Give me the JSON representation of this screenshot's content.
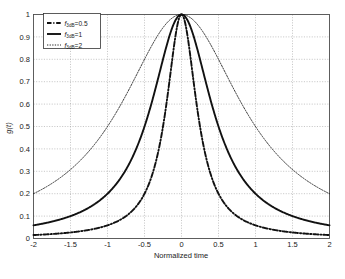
{
  "chart_data": {
    "type": "line",
    "title": "",
    "xlabel": "Normalized time",
    "ylabel": "g(t)",
    "xlim": [
      -2,
      2
    ],
    "ylim": [
      0,
      1
    ],
    "grid": true,
    "legend_position": "upper-left",
    "xticks": [
      "-2",
      "-1.5",
      "-1",
      "-0.5",
      "0",
      "0.5",
      "1",
      "1.5",
      "2"
    ],
    "xtick_values": [
      -2,
      -1.5,
      -1,
      -0.5,
      0,
      0.5,
      1,
      1.5,
      2
    ],
    "yticks": [
      "0",
      "0.1",
      "0.2",
      "0.3",
      "0.4",
      "0.5",
      "0.6",
      "0.7",
      "0.8",
      "0.9",
      "1"
    ],
    "ytick_values": [
      0,
      0.1,
      0.2,
      0.3,
      0.4,
      0.5,
      0.6,
      0.7,
      0.8,
      0.9,
      1
    ],
    "x": [
      -2,
      -1.9,
      -1.8,
      -1.7,
      -1.6,
      -1.5,
      -1.4,
      -1.3,
      -1.2,
      -1.1,
      -1,
      -0.9,
      -0.8,
      -0.7,
      -0.6,
      -0.5,
      -0.4,
      -0.3,
      -0.2,
      -0.1,
      0,
      0.1,
      0.2,
      0.3,
      0.4,
      0.5,
      0.6,
      0.7,
      0.8,
      0.9,
      1,
      1.1,
      1.2,
      1.3,
      1.4,
      1.5,
      1.6,
      1.7,
      1.8,
      1.9,
      2
    ],
    "series": [
      {
        "name": "f3dB=0.5",
        "label_main": "f",
        "label_sub": "3dB",
        "label_tail": "=0.5",
        "style": "dashdot",
        "linewidth": 1.9,
        "color": "#111111",
        "param": 0.5,
        "values": [
          0.01538,
          0.017,
          0.01891,
          0.02119,
          0.02388,
          0.02702,
          0.03091,
          0.0357,
          0.04167,
          0.04914,
          0.05882,
          0.07168,
          0.08912,
          0.11338,
          0.14793,
          0.2,
          0.2809,
          0.40984,
          0.6135,
          0.86207,
          1.0,
          0.86207,
          0.6135,
          0.40984,
          0.2809,
          0.2,
          0.14793,
          0.11338,
          0.08912,
          0.07168,
          0.05882,
          0.04914,
          0.04167,
          0.0357,
          0.03091,
          0.02702,
          0.02388,
          0.02119,
          0.01891,
          0.017,
          0.01538
        ]
      },
      {
        "name": "f3dB=1",
        "label_main": "f",
        "label_sub": "3dB",
        "label_tail": "=1",
        "style": "solid",
        "linewidth": 1.9,
        "color": "#111111",
        "param": 1,
        "values": [
          0.05882,
          0.06477,
          0.07168,
          0.07972,
          0.08912,
          0.1,
          0.11338,
          0.12887,
          0.14793,
          0.17123,
          0.2,
          0.23585,
          0.2809,
          0.33784,
          0.41017,
          0.5,
          0.60976,
          0.73529,
          0.86207,
          0.96154,
          1.0,
          0.96154,
          0.86207,
          0.73529,
          0.60976,
          0.5,
          0.41017,
          0.33784,
          0.2809,
          0.23585,
          0.2,
          0.17123,
          0.14793,
          0.12887,
          0.11338,
          0.1,
          0.08912,
          0.07972,
          0.07168,
          0.06477,
          0.05882
        ]
      },
      {
        "name": "f3dB=2",
        "label_main": "f",
        "label_sub": "3dB",
        "label_tail": "=2",
        "style": "dotted",
        "linewidth": 0.85,
        "color": "#111111",
        "param": 2,
        "values": [
          0.2,
          0.21692,
          0.23585,
          0.25706,
          0.2809,
          0.30769,
          0.33784,
          0.37175,
          0.41017,
          0.45249,
          0.5,
          0.55249,
          0.60976,
          0.67114,
          0.73529,
          0.8,
          0.86207,
          0.91743,
          0.96154,
          0.9901,
          1.0,
          0.9901,
          0.96154,
          0.91743,
          0.86207,
          0.8,
          0.73529,
          0.67114,
          0.60976,
          0.55249,
          0.5,
          0.45249,
          0.41017,
          0.37175,
          0.33784,
          0.30769,
          0.2809,
          0.25706,
          0.23585,
          0.21692,
          0.2
        ]
      }
    ]
  },
  "figure": {
    "background_color": "#ffffff",
    "frame_color": "#4d4d4d",
    "grid_color": "#9a9a9a",
    "curve_color": "#111111"
  }
}
